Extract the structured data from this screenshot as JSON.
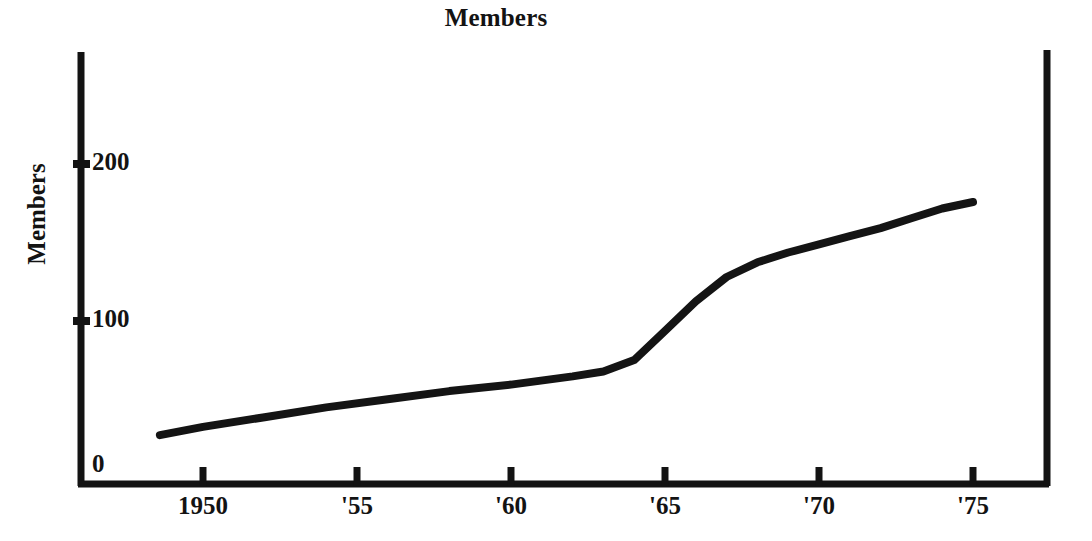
{
  "chart_data": {
    "type": "line",
    "title": "Members",
    "xlabel": "",
    "ylabel": "Members",
    "grid": false,
    "legend": "none",
    "xlim": [
      1948.3,
      1977.6
    ],
    "ylim": [
      0,
      240
    ],
    "x_tick_values": [
      1950,
      1955,
      1960,
      1965,
      1970,
      1975
    ],
    "x_tick_labels": [
      "1950",
      "'55",
      "'60",
      "'65",
      "'70",
      "'75"
    ],
    "y_tick_values": [
      0,
      100,
      200
    ],
    "y_tick_labels": [
      "0",
      "100",
      "200"
    ],
    "series": [
      {
        "name": "Members",
        "x": [
          1948.6,
          1950,
          1952,
          1954,
          1956,
          1958,
          1960,
          1962,
          1963,
          1964,
          1965,
          1966,
          1967,
          1968,
          1969,
          1970,
          1971,
          1972,
          1973,
          1974,
          1975
        ],
        "values": [
          30,
          35,
          41,
          47,
          52,
          57,
          61,
          66,
          69,
          76,
          94,
          112,
          127,
          136,
          142,
          147,
          152,
          157,
          163,
          169,
          173
        ]
      }
    ]
  },
  "axis": {
    "y_tick_200": "200",
    "y_tick_100": "100",
    "y_tick_0": "0",
    "x_tick_1950": "1950",
    "x_tick_55": "'55",
    "x_tick_60": "'60",
    "x_tick_65": "'65",
    "x_tick_70": "'70",
    "x_tick_75": "'75"
  },
  "style": {
    "ink": "#131313",
    "background": "#ffffff",
    "line_color": "#141414"
  }
}
